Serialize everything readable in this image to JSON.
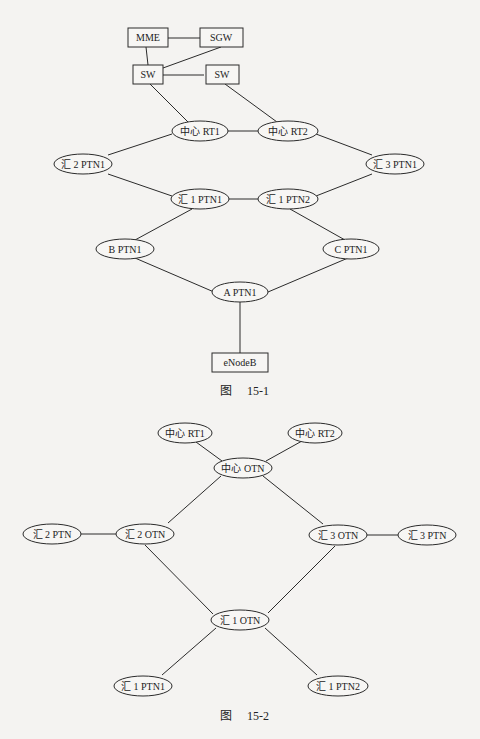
{
  "figure1": {
    "caption_prefix": "图",
    "caption_number": "15-1",
    "nodes": {
      "mme": "MME",
      "sgw": "SGW",
      "sw_left": "SW",
      "sw_right": "SW",
      "center_rt1": "中心 RT1",
      "center_rt2": "中心 RT2",
      "agg2_ptn1": "汇 2 PTN1",
      "agg3_ptn1": "汇 3 PTN1",
      "agg1_ptn1": "汇 1 PTN1",
      "agg1_ptn2": "汇 1 PTN2",
      "b_ptn1": "B PTN1",
      "c_ptn1": "C PTN1",
      "a_ptn1": "A PTN1",
      "enodeb": "eNodeB"
    },
    "edges": [
      [
        "MME",
        "SGW"
      ],
      [
        "MME",
        "SW-left"
      ],
      [
        "SGW",
        "SW-left"
      ],
      [
        "SW-left",
        "SW-right"
      ],
      [
        "SW-left",
        "中心 RT1"
      ],
      [
        "SW-right",
        "中心 RT2"
      ],
      [
        "中心 RT1",
        "中心 RT2"
      ],
      [
        "中心 RT1",
        "汇 2 PTN1"
      ],
      [
        "中心 RT2",
        "汇 3 PTN1"
      ],
      [
        "汇 2 PTN1",
        "汇 1 PTN1"
      ],
      [
        "汇 3 PTN1",
        "汇 1 PTN2"
      ],
      [
        "汇 1 PTN1",
        "汇 1 PTN2"
      ],
      [
        "汇 1 PTN1",
        "B PTN1"
      ],
      [
        "汇 1 PTN2",
        "C PTN1"
      ],
      [
        "B PTN1",
        "A PTN1"
      ],
      [
        "C PTN1",
        "A PTN1"
      ],
      [
        "A PTN1",
        "eNodeB"
      ]
    ]
  },
  "figure2": {
    "caption_prefix": "图",
    "caption_number": "15-2",
    "nodes": {
      "center_rt1": "中心 RT1",
      "center_rt2": "中心 RT2",
      "center_otn": "中心 OTN",
      "agg2_ptn": "汇 2 PTN",
      "agg2_otn": "汇 2 OTN",
      "agg3_otn": "汇 3 OTN",
      "agg3_ptn": "汇 3 PTN",
      "agg1_otn": "汇 1 OTN",
      "agg1_ptn1": "汇 1 PTN1",
      "agg1_ptn2": "汇 1 PTN2"
    },
    "edges": [
      [
        "中心 RT1",
        "中心 OTN"
      ],
      [
        "中心 RT2",
        "中心 OTN"
      ],
      [
        "中心 OTN",
        "汇 2 OTN"
      ],
      [
        "中心 OTN",
        "汇 3 OTN"
      ],
      [
        "汇 2 PTN",
        "汇 2 OTN"
      ],
      [
        "汇 3 OTN",
        "汇 3 PTN"
      ],
      [
        "汇 2 OTN",
        "汇 1 OTN"
      ],
      [
        "汇 3 OTN",
        "汇 1 OTN"
      ],
      [
        "汇 1 OTN",
        "汇 1 PTN1"
      ],
      [
        "汇 1 OTN",
        "汇 1 PTN2"
      ]
    ]
  }
}
